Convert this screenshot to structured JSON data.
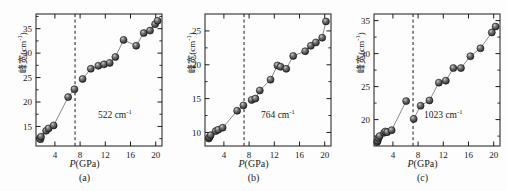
{
  "figure": {
    "caption_tags": [
      "(a)",
      "(b)",
      "(c)"
    ],
    "xlabel_symbol": "P",
    "xlabel_unit": "(GPa)",
    "ylabel_cn": "峰宽",
    "ylabel_unit_open": "(cm",
    "ylabel_unit_sup": "-1",
    "ylabel_unit_close": ")",
    "transition_pressure": 7.2
  },
  "chart_data": [
    {
      "type": "scatter",
      "title": "",
      "panel": "(a)",
      "annotation": "522 cm",
      "annotation_sup": "-1",
      "xlabel": "P(GPa)",
      "ylabel": "峰宽(cm-1)",
      "xlim": [
        1.0,
        21.0
      ],
      "ylim": [
        11.0,
        38.0
      ],
      "xticks": [
        4,
        8,
        12,
        16,
        20
      ],
      "yticks": [
        15,
        20,
        25,
        30,
        35
      ],
      "grid": false,
      "legend": "none",
      "vline": 7.2,
      "x": [
        1.6,
        1.7,
        1.8,
        2.6,
        3.0,
        3.8,
        6.1,
        7.1,
        8.4,
        9.7,
        10.9,
        11.8,
        12.7,
        13.6,
        14.9,
        16.9,
        18.1,
        19.1,
        19.9,
        20.3
      ],
      "y": [
        12.6,
        12.4,
        12.9,
        14.1,
        14.6,
        15.2,
        21.0,
        22.6,
        24.7,
        26.8,
        27.4,
        27.7,
        28.0,
        29.2,
        32.7,
        31.5,
        34.1,
        34.6,
        35.9,
        36.6
      ]
    },
    {
      "type": "scatter",
      "title": "",
      "panel": "(b)",
      "annotation": "764 cm",
      "annotation_sup": "-1",
      "xlabel": "P(GPa)",
      "ylabel": "峰宽(cm-1)",
      "xlim": [
        1.0,
        21.0
      ],
      "ylim": [
        8.0,
        27.5
      ],
      "xticks": [
        4,
        8,
        12,
        16,
        20
      ],
      "yticks": [
        10,
        15,
        20,
        25
      ],
      "grid": false,
      "legend": "none",
      "vline": 7.2,
      "x": [
        1.6,
        1.7,
        1.9,
        2.7,
        3.1,
        3.8,
        6.1,
        7.1,
        8.4,
        9.0,
        9.7,
        11.4,
        12.5,
        13.0,
        13.9,
        15.0,
        16.9,
        17.8,
        18.6,
        19.6,
        20.2
      ],
      "y": [
        9.1,
        9.3,
        9.6,
        10.2,
        10.4,
        10.7,
        13.2,
        14.0,
        14.8,
        15.0,
        16.2,
        17.8,
        19.9,
        19.7,
        19.4,
        21.3,
        22.0,
        22.8,
        23.3,
        24.0,
        26.4
      ]
    },
    {
      "type": "scatter",
      "title": "",
      "panel": "(c)",
      "annotation": "1023 cm",
      "annotation_sup": "-1",
      "xlabel": "P(GPa)",
      "ylabel": "峰宽(cm-1)",
      "xlim": [
        1.0,
        21.0
      ],
      "ylim": [
        16.0,
        36.0
      ],
      "xticks": [
        4,
        8,
        12,
        16,
        20
      ],
      "yticks": [
        20,
        25,
        30,
        35
      ],
      "grid": false,
      "legend": "none",
      "vline": 7.2,
      "x": [
        1.5,
        1.6,
        1.7,
        1.9,
        2.6,
        2.8,
        3.1,
        3.8,
        6.1,
        7.3,
        8.4,
        9.8,
        11.3,
        12.4,
        13.6,
        14.8,
        16.3,
        17.9,
        19.7,
        20.3
      ],
      "y": [
        16.6,
        16.8,
        17.2,
        17.5,
        18.0,
        18.2,
        18.1,
        18.4,
        22.8,
        20.1,
        22.1,
        22.9,
        25.6,
        25.9,
        27.8,
        27.8,
        29.6,
        30.8,
        33.2,
        34.1
      ]
    }
  ]
}
